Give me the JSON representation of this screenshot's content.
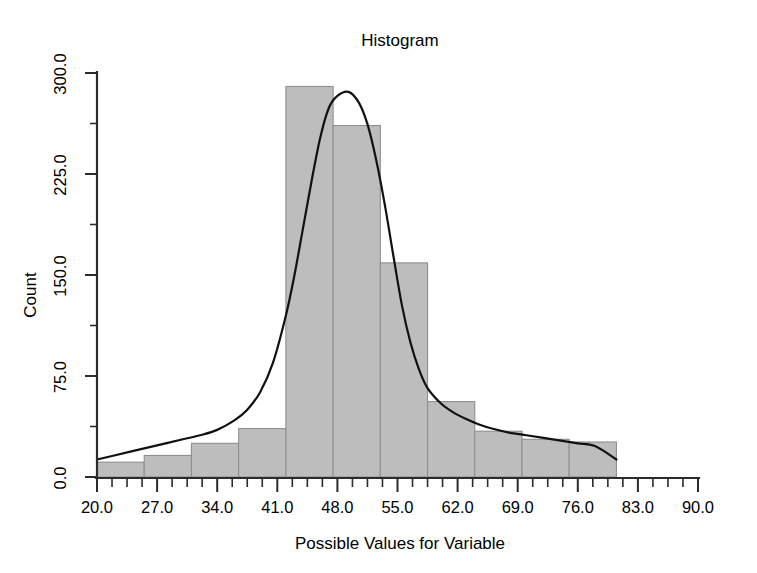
{
  "chart_data": {
    "type": "bar",
    "title": "Histogram",
    "xlabel": "Possible Values for Variable",
    "ylabel": "Count",
    "xlim": [
      20.0,
      90.0
    ],
    "ylim": [
      0.0,
      300.0
    ],
    "grid": false,
    "legend": "none",
    "bin_width": 5.5,
    "bin_edges": [
      20.0,
      25.5,
      31.0,
      36.5,
      42.0,
      47.5,
      53.0,
      58.5,
      64.0,
      69.5,
      75.0,
      80.5
    ],
    "categories": [
      "20.0-25.5",
      "25.5-31.0",
      "31.0-36.5",
      "36.5-42.0",
      "42.0-47.5",
      "47.5-53.0",
      "53.0-58.5",
      "58.5-64.0",
      "64.0-69.5",
      "69.5-75.0",
      "75.0-80.5"
    ],
    "values": [
      11,
      16,
      25,
      36,
      290,
      261,
      159,
      56,
      34,
      28,
      26
    ],
    "xticks": [
      20.0,
      27.0,
      34.0,
      41.0,
      48.0,
      55.0,
      62.0,
      69.0,
      76.0,
      83.0,
      90.0
    ],
    "xtick_labels": [
      "20.0",
      "27.0",
      "34.0",
      "41.0",
      "48.0",
      "55.0",
      "62.0",
      "69.0",
      "76.0",
      "83.0",
      "90.0"
    ],
    "xtick_minor_count": 3,
    "yticks": [
      0.0,
      75.0,
      150.0,
      225.0,
      300.0
    ],
    "ytick_labels": [
      "0.0",
      "75.0",
      "150.0",
      "225.0",
      "300.0"
    ],
    "ytick_minor_count": 1,
    "overlay_curve": {
      "name": "normal-density-fit",
      "type": "line",
      "peak_x": 49.3,
      "peak_y": 286,
      "x": [
        20.0,
        22.0,
        24.0,
        26.0,
        28.0,
        30.0,
        32.0,
        34.0,
        36.0,
        37.5,
        39.0,
        40.5,
        42.0,
        43.0,
        44.0,
        45.0,
        46.0,
        47.0,
        48.0,
        49.3,
        50.5,
        51.5,
        52.5,
        53.5,
        54.5,
        55.5,
        56.5,
        57.5,
        58.5,
        60.0,
        61.5,
        63.0,
        64.5,
        66.0,
        68.0,
        70.0,
        72.0,
        74.0,
        76.0,
        78.0,
        80.5
      ],
      "y": [
        13,
        16,
        19,
        22,
        25,
        28,
        31,
        35,
        42,
        50,
        63,
        85,
        120,
        150,
        185,
        220,
        252,
        274,
        283,
        286,
        278,
        262,
        236,
        203,
        165,
        128,
        100,
        80,
        66,
        55,
        48,
        43,
        39,
        36,
        33,
        31,
        29,
        27,
        25,
        23,
        13
      ]
    }
  },
  "plot_geometry": {
    "x_axis_left_px": 97,
    "x_axis_right_px": 698,
    "baseline_y_px": 477,
    "top_y_px": 73
  }
}
